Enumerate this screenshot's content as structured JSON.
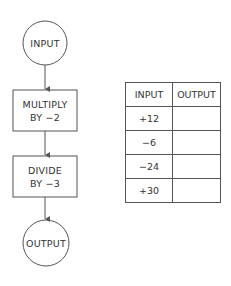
{
  "flowchart": {
    "start": {
      "label": "INPUT"
    },
    "steps": [
      {
        "line1": "MULTIPLY",
        "line2": "BY −2"
      },
      {
        "line1": "DIVIDE",
        "line2": "BY −3"
      }
    ],
    "end": {
      "label": "OUTPUT"
    }
  },
  "table": {
    "headers": [
      "INPUT",
      "OUTPUT"
    ],
    "rows": [
      {
        "input": "+12",
        "output": ""
      },
      {
        "input": "−6",
        "output": ""
      },
      {
        "input": "−24",
        "output": ""
      },
      {
        "input": "+30",
        "output": ""
      }
    ]
  },
  "colors": {
    "stroke": "#555555",
    "text": "#333333",
    "background": "#ffffff"
  }
}
